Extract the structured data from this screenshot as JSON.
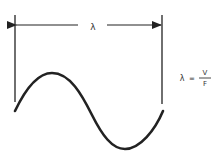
{
  "diagram": {
    "dimension_label": "λ",
    "formula": {
      "lhs": "λ",
      "equals": "=",
      "numerator": "V",
      "denominator": "F"
    },
    "colors": {
      "stroke": "#222222",
      "background": "#ffffff"
    }
  }
}
